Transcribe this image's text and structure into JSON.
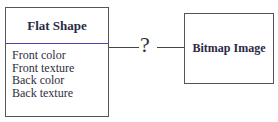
{
  "left_box": {
    "title": "Flat Shape",
    "attributes": [
      "Front color",
      "Front texture",
      "Back color",
      "Back texture"
    ]
  },
  "connector": {
    "label": "?"
  },
  "right_box": {
    "title": "Bitmap Image"
  },
  "colors": {
    "divider": "#4a4ab0",
    "border": "#555555"
  }
}
